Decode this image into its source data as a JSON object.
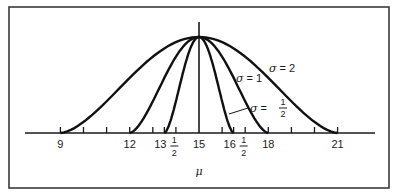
{
  "chart_data": {
    "type": "line",
    "title": "",
    "xlabel": "μ",
    "ylabel": "",
    "xlim": [
      8,
      22
    ],
    "grid": false,
    "legend": "inline annotations",
    "center": 15,
    "x_ticks": [
      9,
      10,
      11,
      12,
      13,
      13.5,
      14,
      15,
      16,
      16.5,
      17,
      18,
      19,
      20,
      21
    ],
    "tick_labels": [
      {
        "value": 9,
        "label": "9"
      },
      {
        "value": 12,
        "label": "12"
      },
      {
        "value": 13.5,
        "whole": "13",
        "num": "1",
        "den": "2"
      },
      {
        "value": 15,
        "label": "15"
      },
      {
        "value": 16.5,
        "whole": "16",
        "num": "1",
        "den": "2"
      },
      {
        "value": 18,
        "label": "18"
      },
      {
        "value": 21,
        "label": "21"
      }
    ],
    "series": [
      {
        "name": "σ = 2",
        "sigma": 2,
        "support": [
          9,
          21
        ],
        "peak_x": 15
      },
      {
        "name": "σ = 1",
        "sigma": 1,
        "support": [
          12,
          18
        ],
        "peak_x": 15
      },
      {
        "name": "σ = 1/2",
        "sigma": 0.5,
        "support": [
          13.5,
          16.5
        ],
        "peak_x": 15
      }
    ],
    "annotations": [
      {
        "text": "σ = 2",
        "sym": "σ",
        "eq": " = 2"
      },
      {
        "text": "σ = 1",
        "sym": "σ",
        "eq": " = 1"
      },
      {
        "text": "σ = 1/2",
        "sym": "σ",
        "eq": " = ",
        "num": "1",
        "den": "2"
      }
    ]
  }
}
